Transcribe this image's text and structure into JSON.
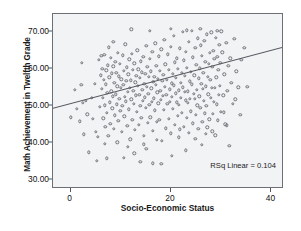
{
  "chart_data": {
    "type": "scatter",
    "title": "",
    "xlabel": "Socio-Economic Status",
    "ylabel": "Math Achievement in Twelfth Grade",
    "xlim": [
      -3.5,
      42.5
    ],
    "ylim": [
      27.5,
      75.0
    ],
    "xticks": [
      0,
      20,
      40
    ],
    "xticklabels": [
      "0",
      "20",
      "40"
    ],
    "yticks": [
      30,
      40,
      50,
      60,
      70
    ],
    "yticklabels": [
      "30.00",
      "40.00",
      "50.00",
      "60.00",
      "70.00"
    ],
    "grid": false,
    "legend": null,
    "marker": "open-circle",
    "marker_color": "#6f7378",
    "plot_background": "#f2f3f5",
    "frame_color": "#6c6f75",
    "annotations": [
      {
        "text": "RSq Linear = 0.104",
        "position": "lower-right"
      }
    ],
    "fit_line": {
      "type": "linear",
      "rsq": 0.104,
      "color": "#555a60",
      "x_start": -3.5,
      "y_start": 49.1,
      "x_end": 42.5,
      "y_end": 65.8
    },
    "points": [
      [
        0.1,
        47.0
      ],
      [
        0.9,
        54.4
      ],
      [
        1.8,
        45.9
      ],
      [
        2.2,
        61.8
      ],
      [
        2.4,
        50.9
      ],
      [
        2.6,
        42.3
      ],
      [
        3.0,
        51.4
      ],
      [
        3.6,
        37.5
      ],
      [
        4.4,
        46.5
      ],
      [
        4.8,
        56.0
      ],
      [
        5.0,
        43.0
      ],
      [
        5.2,
        35.2
      ],
      [
        5.6,
        62.5
      ],
      [
        5.8,
        49.8
      ],
      [
        6.0,
        58.4
      ],
      [
        6.1,
        63.6
      ],
      [
        6.2,
        54.7
      ],
      [
        6.3,
        60.2
      ],
      [
        6.4,
        52.3
      ],
      [
        6.5,
        46.7
      ],
      [
        6.6,
        57.1
      ],
      [
        6.7,
        64.0
      ],
      [
        6.8,
        50.2
      ],
      [
        6.9,
        44.3
      ],
      [
        7.0,
        55.9
      ],
      [
        7.1,
        59.7
      ],
      [
        7.2,
        48.1
      ],
      [
        7.3,
        53.6
      ],
      [
        7.4,
        61.1
      ],
      [
        7.5,
        41.9
      ],
      [
        7.6,
        66.0
      ],
      [
        7.7,
        57.8
      ],
      [
        7.8,
        51.0
      ],
      [
        7.9,
        45.2
      ],
      [
        8.0,
        63.1
      ],
      [
        8.1,
        54.0
      ],
      [
        8.2,
        58.9
      ],
      [
        8.3,
        49.4
      ],
      [
        8.4,
        52.7
      ],
      [
        8.5,
        60.8
      ],
      [
        8.6,
        43.8
      ],
      [
        8.7,
        56.3
      ],
      [
        8.8,
        47.5
      ],
      [
        8.9,
        62.0
      ],
      [
        9.0,
        53.2
      ],
      [
        9.1,
        59.0
      ],
      [
        9.2,
        50.5
      ],
      [
        9.3,
        55.4
      ],
      [
        9.4,
        64.5
      ],
      [
        9.5,
        46.0
      ],
      [
        9.6,
        58.1
      ],
      [
        9.7,
        52.0
      ],
      [
        9.8,
        61.4
      ],
      [
        9.9,
        48.7
      ],
      [
        10.0,
        54.9
      ],
      [
        10.1,
        57.3
      ],
      [
        10.2,
        43.1
      ],
      [
        10.3,
        50.0
      ],
      [
        10.4,
        63.8
      ],
      [
        10.5,
        55.7
      ],
      [
        10.6,
        59.5
      ],
      [
        10.7,
        47.2
      ],
      [
        10.8,
        52.6
      ],
      [
        10.9,
        66.8
      ],
      [
        11.0,
        51.3
      ],
      [
        11.1,
        56.8
      ],
      [
        11.2,
        60.5
      ],
      [
        11.3,
        44.6
      ],
      [
        11.4,
        53.9
      ],
      [
        11.5,
        58.6
      ],
      [
        11.6,
        49.1
      ],
      [
        11.7,
        62.7
      ],
      [
        11.8,
        55.0
      ],
      [
        11.9,
        41.0
      ],
      [
        12.0,
        57.0
      ],
      [
        12.1,
        51.8
      ],
      [
        12.2,
        64.2
      ],
      [
        12.3,
        46.3
      ],
      [
        12.4,
        59.9
      ],
      [
        12.5,
        54.2
      ],
      [
        12.6,
        50.7
      ],
      [
        12.7,
        61.6
      ],
      [
        12.8,
        43.5
      ],
      [
        12.9,
        56.5
      ],
      [
        13.0,
        52.9
      ],
      [
        13.1,
        58.3
      ],
      [
        13.2,
        48.4
      ],
      [
        13.3,
        65.1
      ],
      [
        13.4,
        55.5
      ],
      [
        13.5,
        60.0
      ],
      [
        13.6,
        44.9
      ],
      [
        13.7,
        53.0
      ],
      [
        13.8,
        57.6
      ],
      [
        13.9,
        50.1
      ],
      [
        14.0,
        62.2
      ],
      [
        14.1,
        46.8
      ],
      [
        14.2,
        59.2
      ],
      [
        14.3,
        54.5
      ],
      [
        14.4,
        51.5
      ],
      [
        14.5,
        63.3
      ],
      [
        14.6,
        42.0
      ],
      [
        14.7,
        56.1
      ],
      [
        14.8,
        52.4
      ],
      [
        14.9,
        58.8
      ],
      [
        15.0,
        49.6
      ],
      [
        15.1,
        66.3
      ],
      [
        15.2,
        55.2
      ],
      [
        15.3,
        60.7
      ],
      [
        15.4,
        45.5
      ],
      [
        15.5,
        53.4
      ],
      [
        15.6,
        57.9
      ],
      [
        15.7,
        50.3
      ],
      [
        15.8,
        62.9
      ],
      [
        15.9,
        47.0
      ],
      [
        16.0,
        59.4
      ],
      [
        16.1,
        54.8
      ],
      [
        16.2,
        51.1
      ],
      [
        16.3,
        64.8
      ],
      [
        16.4,
        43.3
      ],
      [
        16.5,
        56.6
      ],
      [
        16.6,
        52.1
      ],
      [
        16.7,
        58.0
      ],
      [
        16.8,
        48.9
      ],
      [
        16.9,
        67.0
      ],
      [
        17.0,
        55.8
      ],
      [
        17.1,
        61.0
      ],
      [
        17.2,
        45.8
      ],
      [
        17.3,
        53.7
      ],
      [
        17.4,
        57.4
      ],
      [
        17.5,
        50.8
      ],
      [
        17.6,
        63.5
      ],
      [
        17.7,
        46.2
      ],
      [
        17.8,
        59.6
      ],
      [
        17.9,
        54.1
      ],
      [
        18.0,
        51.7
      ],
      [
        18.1,
        65.4
      ],
      [
        18.2,
        40.5
      ],
      [
        18.3,
        56.9
      ],
      [
        18.4,
        52.8
      ],
      [
        18.5,
        58.5
      ],
      [
        18.6,
        49.0
      ],
      [
        18.7,
        68.0
      ],
      [
        18.8,
        55.3
      ],
      [
        18.9,
        61.3
      ],
      [
        19.0,
        44.0
      ],
      [
        19.1,
        53.1
      ],
      [
        19.2,
        57.2
      ],
      [
        19.3,
        50.6
      ],
      [
        19.4,
        64.1
      ],
      [
        19.5,
        46.6
      ],
      [
        19.6,
        59.8
      ],
      [
        19.7,
        54.6
      ],
      [
        19.8,
        51.2
      ],
      [
        19.9,
        66.1
      ],
      [
        20.0,
        42.6
      ],
      [
        20.1,
        56.2
      ],
      [
        20.2,
        52.5
      ],
      [
        20.3,
        58.7
      ],
      [
        20.4,
        49.3
      ],
      [
        20.5,
        69.0
      ],
      [
        20.6,
        55.6
      ],
      [
        20.7,
        61.9
      ],
      [
        20.8,
        45.0
      ],
      [
        20.9,
        53.5
      ],
      [
        21.0,
        57.7
      ],
      [
        21.1,
        51.0
      ],
      [
        21.2,
        63.0
      ],
      [
        21.3,
        47.4
      ],
      [
        21.4,
        60.1
      ],
      [
        21.5,
        54.3
      ],
      [
        21.6,
        50.4
      ],
      [
        21.7,
        65.7
      ],
      [
        21.8,
        43.7
      ],
      [
        21.9,
        56.4
      ],
      [
        22.0,
        52.2
      ],
      [
        22.1,
        59.1
      ],
      [
        22.2,
        48.2
      ],
      [
        22.3,
        70.2
      ],
      [
        22.4,
        55.1
      ],
      [
        22.5,
        62.4
      ],
      [
        22.6,
        44.4
      ],
      [
        22.7,
        53.8
      ],
      [
        22.8,
        58.2
      ],
      [
        22.9,
        51.6
      ],
      [
        23.0,
        64.7
      ],
      [
        23.1,
        46.9
      ],
      [
        23.2,
        60.4
      ],
      [
        23.3,
        54.0
      ],
      [
        23.4,
        50.9
      ],
      [
        23.5,
        67.5
      ],
      [
        23.6,
        42.8
      ],
      [
        23.7,
        56.7
      ],
      [
        23.8,
        52.0
      ],
      [
        23.9,
        59.3
      ],
      [
        24.0,
        48.6
      ],
      [
        24.1,
        70.5
      ],
      [
        24.2,
        55.9
      ],
      [
        24.3,
        63.2
      ],
      [
        24.4,
        45.3
      ],
      [
        24.5,
        53.3
      ],
      [
        24.6,
        58.4
      ],
      [
        24.7,
        51.9
      ],
      [
        24.8,
        65.9
      ],
      [
        24.9,
        47.7
      ],
      [
        25.0,
        61.2
      ],
      [
        25.1,
        54.4
      ],
      [
        25.2,
        50.2
      ],
      [
        25.3,
        68.4
      ],
      [
        25.4,
        43.9
      ],
      [
        25.5,
        57.5
      ],
      [
        25.6,
        52.7
      ],
      [
        25.7,
        60.3
      ],
      [
        25.8,
        49.5
      ],
      [
        25.9,
        66.5
      ],
      [
        26.0,
        56.0
      ],
      [
        26.1,
        63.7
      ],
      [
        26.2,
        45.7
      ],
      [
        26.3,
        54.7
      ],
      [
        26.4,
        59.0
      ],
      [
        26.5,
        51.4
      ],
      [
        26.6,
        67.8
      ],
      [
        26.7,
        48.0
      ],
      [
        26.8,
        62.1
      ],
      [
        26.9,
        55.4
      ],
      [
        27.0,
        50.0
      ],
      [
        27.1,
        69.5
      ],
      [
        27.2,
        44.2
      ],
      [
        27.3,
        58.0
      ],
      [
        27.4,
        53.2
      ],
      [
        27.5,
        61.5
      ],
      [
        27.6,
        46.4
      ],
      [
        27.7,
        64.4
      ],
      [
        27.8,
        57.1
      ],
      [
        27.9,
        52.3
      ],
      [
        28.0,
        70.0
      ],
      [
        28.1,
        55.0
      ],
      [
        28.2,
        60.6
      ],
      [
        28.3,
        47.9
      ],
      [
        28.4,
        65.0
      ],
      [
        28.5,
        51.1
      ],
      [
        28.6,
        62.8
      ],
      [
        28.7,
        54.9
      ],
      [
        28.8,
        42.1
      ],
      [
        28.9,
        68.6
      ],
      [
        29.0,
        57.8
      ],
      [
        29.1,
        50.5
      ],
      [
        29.2,
        63.4
      ],
      [
        29.3,
        46.1
      ],
      [
        29.4,
        59.9
      ],
      [
        29.5,
        53.0
      ],
      [
        29.6,
        66.7
      ],
      [
        29.7,
        55.5
      ],
      [
        29.8,
        61.7
      ],
      [
        29.9,
        48.5
      ],
      [
        30.0,
        70.3
      ],
      [
        30.2,
        64.6
      ],
      [
        30.4,
        52.9
      ],
      [
        30.6,
        58.6
      ],
      [
        30.8,
        45.1
      ],
      [
        31.0,
        67.2
      ],
      [
        31.2,
        54.2
      ],
      [
        31.4,
        60.9
      ],
      [
        31.6,
        39.3
      ],
      [
        31.8,
        63.0
      ],
      [
        32.0,
        56.3
      ],
      [
        32.3,
        50.7
      ],
      [
        32.6,
        68.2
      ],
      [
        33.0,
        59.4
      ],
      [
        33.4,
        55.1
      ],
      [
        34.0,
        62.6
      ],
      [
        34.6,
        65.8
      ],
      [
        35.2,
        55.3
      ],
      [
        8.5,
        67.4
      ],
      [
        12.1,
        70.8
      ],
      [
        15.8,
        70.5
      ],
      [
        19.9,
        71.0
      ],
      [
        23.1,
        70.6
      ],
      [
        25.8,
        70.9
      ],
      [
        29.2,
        70.4
      ],
      [
        7.2,
        35.8
      ],
      [
        10.6,
        36.0
      ],
      [
        13.9,
        34.8
      ],
      [
        16.4,
        34.5
      ],
      [
        18.1,
        34.3
      ],
      [
        11.4,
        38.9
      ],
      [
        14.6,
        39.6
      ],
      [
        9.3,
        40.2
      ],
      [
        17.2,
        40.8
      ],
      [
        21.6,
        41.5
      ],
      [
        24.8,
        41.2
      ],
      [
        26.1,
        39.5
      ],
      [
        5.4,
        41.7
      ],
      [
        6.8,
        39.8
      ],
      [
        20.2,
        36.5
      ],
      [
        22.9,
        38.0
      ],
      [
        12.7,
        37.2
      ],
      [
        15.1,
        38.4
      ],
      [
        4.2,
        52.2
      ],
      [
        3.3,
        47.8
      ],
      [
        2.1,
        55.8
      ],
      [
        1.2,
        49.2
      ],
      [
        33.8,
        47.6
      ],
      [
        31.1,
        44.8
      ],
      [
        28.2,
        43.2
      ],
      [
        26.9,
        42.4
      ],
      [
        30.5,
        48.3
      ],
      [
        32.8,
        51.8
      ]
    ]
  },
  "annotation": {
    "rsq_text": "RSq Linear = 0.104"
  }
}
